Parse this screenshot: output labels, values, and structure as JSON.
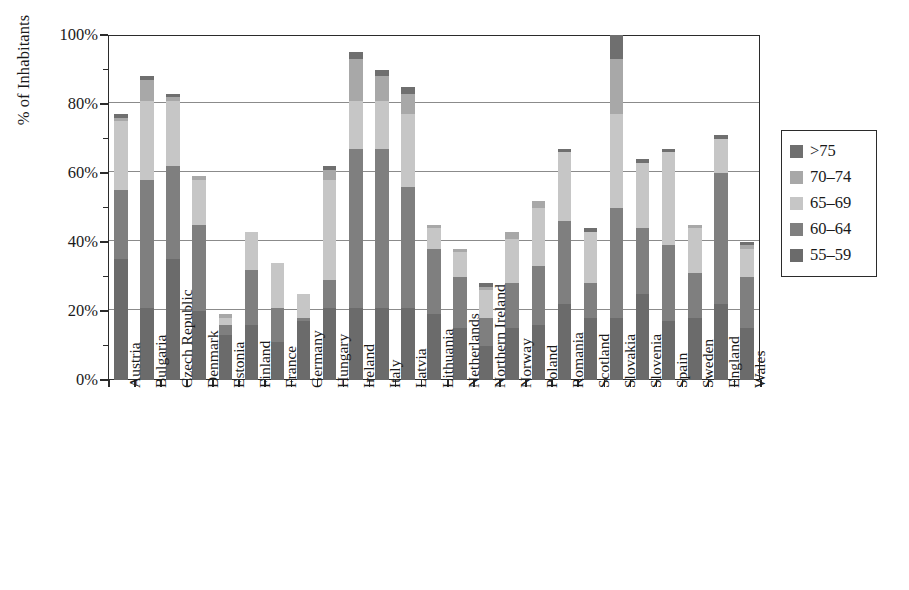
{
  "chart_data": {
    "type": "bar",
    "subtype": "stacked-bar-vertical",
    "title": "",
    "xlabel": "",
    "ylabel": "% of Inhabitants",
    "ylim": [
      0,
      100
    ],
    "ytick_labels": [
      "0%",
      "20%",
      "40%",
      "60%",
      "80%",
      "100%"
    ],
    "ytick_values": [
      0,
      20,
      40,
      60,
      80,
      100
    ],
    "yminor_tick_values": [
      10,
      30,
      50,
      70,
      90
    ],
    "grid": "horizontal",
    "legend_position": "right-outside",
    "categories": [
      "Austria",
      "Bulgaria",
      "Czech Republic",
      "Denmark",
      "Estonia",
      "Finland",
      "France",
      "Germany",
      "Hungary",
      "Ireland",
      "Italy",
      "Latvia",
      "Lithuania",
      "Netherlands",
      "Northern Ireland",
      "Norway",
      "Poland",
      "Romania",
      "Scotland",
      "Slovakia",
      "Slovenia",
      "Spain",
      "Sweden",
      "England",
      "Wales"
    ],
    "series": [
      {
        "name": "55-59",
        "color": "#6b6b6b",
        "values": [
          35,
          21,
          35,
          20,
          13,
          16,
          11,
          17,
          21,
          21,
          21,
          21,
          19,
          15,
          10,
          15,
          16,
          22,
          18,
          18,
          25,
          17,
          18,
          22,
          15
        ]
      },
      {
        "name": "60-64",
        "color": "#7f7f7f",
        "values": [
          20,
          37,
          27,
          25,
          3,
          16,
          10,
          1,
          8,
          46,
          46,
          35,
          19,
          15,
          8,
          13,
          17,
          24,
          10,
          32,
          19,
          22,
          13,
          38,
          15
        ]
      },
      {
        "name": "65-69",
        "color": "#c6c6c6",
        "values": [
          20,
          23,
          19,
          13,
          2,
          11,
          13,
          7,
          29,
          14,
          14,
          21,
          6,
          7,
          8,
          13,
          17,
          20,
          15,
          27,
          19,
          27,
          13,
          10,
          8
        ]
      },
      {
        "name": "70-74",
        "color": "#a8a8a8",
        "values": [
          1,
          6,
          1,
          1,
          1,
          0,
          0,
          0,
          3,
          12,
          7,
          6,
          1,
          1,
          1,
          2,
          2,
          0,
          0,
          16,
          0,
          0,
          1,
          0,
          1
        ]
      },
      {
        "name": ">75",
        "color": "#6f6f6f",
        "values": [
          1,
          1,
          1,
          0,
          0,
          0,
          0,
          0,
          1,
          2,
          2,
          2,
          0,
          0,
          1,
          0,
          0,
          1,
          1,
          7,
          1,
          1,
          0,
          1,
          1
        ]
      }
    ],
    "totals": [
      77,
      88,
      83,
      59,
      19,
      43,
      34,
      25,
      62,
      95,
      90,
      85,
      45,
      38,
      28,
      43,
      52,
      67,
      44,
      100,
      64,
      67,
      45,
      71,
      40
    ]
  },
  "legend": {
    "items": [
      {
        "label": ">75",
        "color": "#6f6f6f"
      },
      {
        "label": "70–74",
        "color": "#a8a8a8"
      },
      {
        "label": "65–69",
        "color": "#c6c6c6"
      },
      {
        "label": "60–64",
        "color": "#7f7f7f"
      },
      {
        "label": "55–59",
        "color": "#6b6b6b"
      }
    ]
  },
  "axis": {
    "y_title": "% of Inhabitants"
  },
  "colors": {
    "axis": "#2b2b2b",
    "grid": "#8b8b8b",
    "background": "#ffffff",
    "text": "#1a1a1a"
  }
}
